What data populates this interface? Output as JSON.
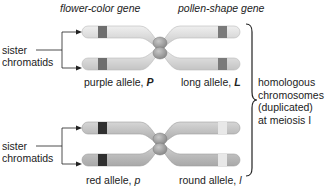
{
  "headers": {
    "gene1": "flower-color gene",
    "gene2": "pollen-shape gene"
  },
  "top_pair": {
    "left_allele_label": "purple allele, ",
    "left_allele_symbol": "P",
    "right_allele_label": "long allele, ",
    "right_allele_symbol": "L",
    "flower_band_color": "#6e6e6e",
    "pollen_band_color": "#7a7a7a"
  },
  "bottom_pair": {
    "left_allele_label": "red allele, ",
    "left_allele_symbol": "p",
    "right_allele_label": "round allele, ",
    "right_allele_symbol": "l",
    "flower_band_color": "#2f2f2f",
    "pollen_band_color": "#e6e6e6"
  },
  "sister_label_top": [
    "sister",
    "chromatids"
  ],
  "sister_label_bottom": [
    "sister",
    "chromatids"
  ],
  "bracket_label": [
    "homologous",
    "chromosomes",
    "(duplicated)",
    "at meiosis I"
  ],
  "colors": {
    "chromatid_fill": "#d9d9d9",
    "chromatid_edge": "#bdbdbd",
    "centromere": "#9a9a9a"
  }
}
